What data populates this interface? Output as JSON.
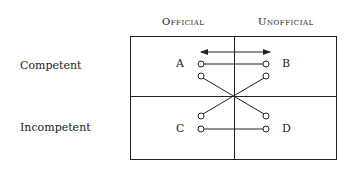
{
  "columns": {
    "official": "Official",
    "unofficial": "Unofficial"
  },
  "rows": {
    "competent": "Competent",
    "incompetent": "Incompetent"
  },
  "nodes": {
    "a": "A",
    "b": "B",
    "c": "C",
    "d": "D"
  },
  "connections": [
    {
      "from": "A",
      "to": "B",
      "type": "horizontal"
    },
    {
      "from": "A",
      "to": "D",
      "type": "diagonal"
    },
    {
      "from": "B",
      "to": "C",
      "type": "diagonal"
    },
    {
      "from": "C",
      "to": "D",
      "type": "horizontal"
    }
  ],
  "arrow": {
    "type": "double-headed",
    "position": "top"
  }
}
